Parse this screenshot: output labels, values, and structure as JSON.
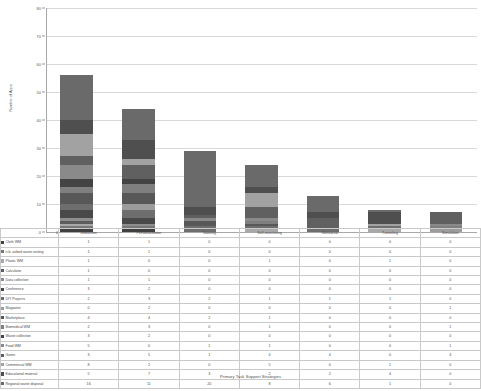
{
  "chart_data": {
    "type": "bar",
    "subtype": "stacked-bar-with-data-table",
    "title": "",
    "xlabel": "Primary Task Support Strategies",
    "ylabel": "Number of Apps",
    "ylim": [
      0,
      80
    ],
    "ytick_step": 10,
    "yticks": [
      0,
      10,
      20,
      30,
      40,
      50,
      60,
      70,
      80
    ],
    "grid": true,
    "legend_position": "data-table-row-labels",
    "categories": [
      "Reduction",
      "Personalization",
      "Tailoring",
      "Self-monitoring",
      "Rehearsal",
      "Tunneling",
      "Simulation"
    ],
    "series": [
      {
        "name": "Cloth WM",
        "color": "#3f3f3f",
        "values": [
          1,
          1,
          0,
          0,
          0,
          0,
          0
        ]
      },
      {
        "name": "n.b. airbed waste sorting",
        "color": "#767676",
        "values": [
          1,
          1,
          0,
          0,
          0,
          0,
          0
        ]
      },
      {
        "name": "Plastic WM",
        "color": "#a8a8a8",
        "values": [
          1,
          0,
          0,
          1,
          0,
          1,
          0
        ]
      },
      {
        "name": "Calculator",
        "color": "#5c5c5c",
        "values": [
          1,
          0,
          0,
          0,
          0,
          0,
          0
        ]
      },
      {
        "name": "Data collection",
        "color": "#8e8e8e",
        "values": [
          1,
          1,
          0,
          0,
          0,
          0,
          0
        ]
      },
      {
        "name": "Conference",
        "color": "#494949",
        "values": [
          3,
          2,
          0,
          0,
          0,
          0,
          0
        ]
      },
      {
        "name": "DIY Projects",
        "color": "#6e6e6e",
        "values": [
          2,
          3,
          2,
          1,
          1,
          1,
          0
        ]
      },
      {
        "name": "Magazine",
        "color": "#9c9c9c",
        "values": [
          0,
          2,
          0,
          0,
          0,
          0,
          1
        ]
      },
      {
        "name": "Marketplace",
        "color": "#585858",
        "values": [
          4,
          4,
          2,
          1,
          0,
          0,
          0
        ]
      },
      {
        "name": "Biomedical WM",
        "color": "#7f7f7f",
        "values": [
          2,
          3,
          0,
          1,
          0,
          0,
          1
        ]
      },
      {
        "name": "Waste collection",
        "color": "#434343",
        "values": [
          3,
          2,
          0,
          0,
          0,
          0,
          0
        ]
      },
      {
        "name": "Food WM",
        "color": "#8a8a8a",
        "values": [
          5,
          0,
          1,
          1,
          0,
          0,
          1
        ]
      },
      {
        "name": "Game",
        "color": "#606060",
        "values": [
          3,
          5,
          1,
          4,
          4,
          0,
          4
        ]
      },
      {
        "name": "Commercial WM",
        "color": "#a2a2a2",
        "values": [
          8,
          2,
          0,
          5,
          0,
          1,
          0
        ]
      },
      {
        "name": "Educational material",
        "color": "#4f4f4f",
        "values": [
          5,
          7,
          3,
          2,
          2,
          4,
          0
        ]
      },
      {
        "name": "Regional waste disposal",
        "color": "#6a6a6a",
        "values": [
          16,
          11,
          20,
          8,
          6,
          1,
          0
        ]
      }
    ],
    "column_totals": [
      56,
      44,
      29,
      24,
      13,
      8,
      7
    ],
    "table_header_blank": "0"
  },
  "axis": {
    "y_title": "Number of Apps",
    "x_title": "Primary Task Support Strategies"
  }
}
